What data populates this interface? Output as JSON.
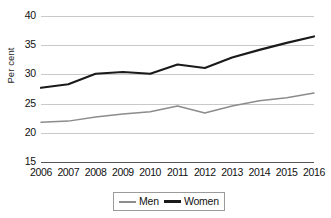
{
  "chart_data": {
    "type": "line",
    "title": "",
    "xlabel": "",
    "ylabel": "Per cent",
    "categories": [
      "2006",
      "2007",
      "2008",
      "2009",
      "2010",
      "2011",
      "2012",
      "2013",
      "2014",
      "2015",
      "2016"
    ],
    "ylim": [
      15,
      40
    ],
    "yticks": [
      15,
      20,
      25,
      30,
      35,
      40
    ],
    "ytick_labels": [
      "15",
      "20",
      "25",
      "30",
      "35",
      "40"
    ],
    "grid": true,
    "legend_position": "bottom-center",
    "series": [
      {
        "name": "Men",
        "color": "#8c8c8c",
        "values": [
          21.8,
          22.0,
          22.7,
          23.2,
          23.6,
          24.6,
          23.4,
          24.6,
          25.5,
          26.0,
          26.8
        ]
      },
      {
        "name": "Women",
        "color": "#1a1a1a",
        "values": [
          27.7,
          28.3,
          30.1,
          30.4,
          30.1,
          31.7,
          31.1,
          32.9,
          34.2,
          35.4,
          36.5
        ]
      }
    ]
  }
}
